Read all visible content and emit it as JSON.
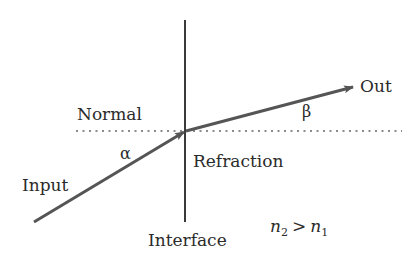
{
  "diagram": {
    "labels": {
      "normal": "Normal",
      "alpha": "α",
      "input": "Input",
      "refraction": "Refraction",
      "beta": "β",
      "out": "Out",
      "interface": "Interface"
    },
    "relation": {
      "lhs_symbol": "n",
      "lhs_sub": "2",
      "operator": ">",
      "rhs_symbol": "n",
      "rhs_sub": "1"
    },
    "colors": {
      "line": "#3a3a3a",
      "arrow": "#555555",
      "dotted": "#666666",
      "text": "#2b2b2b"
    },
    "elements": [
      {
        "id": "interface-line",
        "type": "solid-line",
        "orientation": "vertical"
      },
      {
        "id": "normal-line",
        "type": "dotted-line",
        "orientation": "horizontal"
      },
      {
        "id": "input-ray",
        "type": "arrow",
        "direction": "toward interface"
      },
      {
        "id": "output-ray",
        "type": "arrow",
        "direction": "away from interface"
      }
    ]
  }
}
